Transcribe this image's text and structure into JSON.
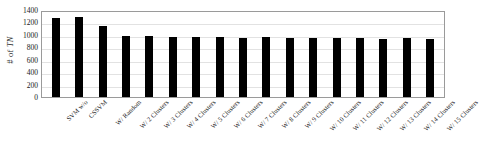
{
  "chart_data": {
    "type": "bar",
    "title": "",
    "subtitle": "",
    "xlabel": "",
    "ylabel": "# of TN",
    "ylabel_parts": {
      "prefix": "# of ",
      "italic": "TN"
    },
    "ylim": [
      0,
      1400
    ],
    "ytick_step": 200,
    "yticks": [
      0,
      200,
      400,
      600,
      800,
      1000,
      1200,
      1400
    ],
    "ytick_labels": [
      "0",
      "200",
      "400",
      "600",
      "800",
      "1000",
      "1200",
      "1400"
    ],
    "grid": true,
    "grid_axis": "y",
    "legend": false,
    "legend_position": "none",
    "bar_color": "#000000",
    "plot_border_color": "#9a9a9a",
    "gridline_color": "#e2e2e2",
    "background_color": "#ffffff",
    "xtick_rotation": -45,
    "categories": [
      "SVM w/o",
      "CSSVM",
      "W/ Random",
      "W/ 2 Clusters",
      "W/ 3 Clusters",
      "W/ 4 Clusters",
      "W/ 5 Clusters",
      "W/ 6 Clusters",
      "W/ 7 Clusters",
      "W/ 8 Clusters",
      "W/ 9 Clusters",
      "W/ 10 Clusters",
      "W/ 11 Clusters",
      "W/ 12 Clusters",
      "W/ 13 Clusters",
      "W/ 14 Clusters",
      "W/ 15 Clusters"
    ],
    "values": [
      1265,
      1280,
      1140,
      975,
      975,
      970,
      960,
      965,
      955,
      960,
      950,
      955,
      945,
      950,
      940,
      945,
      930
    ]
  }
}
